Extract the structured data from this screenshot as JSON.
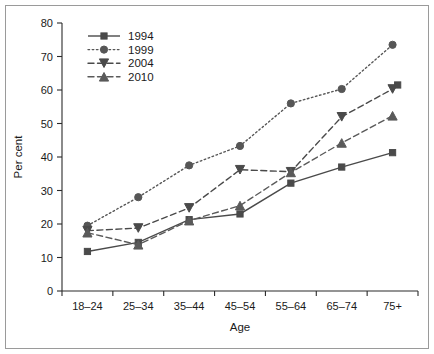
{
  "chart_data": {
    "type": "line",
    "title": "",
    "xlabel": "Age",
    "ylabel": "Per cent",
    "categories": [
      "18–24",
      "25–34",
      "35–44",
      "45–54",
      "55–64",
      "65–74",
      "75+"
    ],
    "ylim": [
      0,
      80
    ],
    "yticks": [
      0,
      10,
      20,
      30,
      40,
      50,
      60,
      70,
      80
    ],
    "grid": false,
    "legend_position": "top-left inside",
    "series": [
      {
        "name": "1994",
        "marker": "square",
        "linestyle": "solid",
        "color": "#4a4a4a",
        "values": [
          11.8,
          14.5,
          21.3,
          23.0,
          32.2,
          37.0,
          41.3
        ]
      },
      {
        "name": "1999",
        "marker": "circle",
        "linestyle": "dotted",
        "color": "#565656",
        "values": [
          19.5,
          28.0,
          37.5,
          43.3,
          56.0,
          60.3,
          73.5
        ]
      },
      {
        "name": "2004",
        "marker": "triangle-down",
        "linestyle": "dashed",
        "color": "#4a4a4a",
        "values": [
          18.0,
          18.8,
          24.8,
          36.2,
          35.6,
          52.0,
          60.3
        ]
      },
      {
        "name": "2010",
        "marker": "triangle-up",
        "linestyle": "dashed",
        "color": "#5a5a5a",
        "values": [
          17.4,
          13.8,
          21.0,
          25.5,
          35.4,
          44.2,
          52.3
        ]
      }
    ],
    "extra_points": [
      {
        "series": "1994",
        "marker": "square",
        "x_fraction": 6.6,
        "value": 61.5
      }
    ]
  }
}
